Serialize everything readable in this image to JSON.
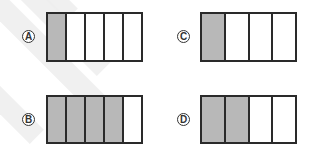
{
  "colors": {
    "shaded": "#b8b8b8",
    "unshaded": "#ffffff",
    "stroke": "#2a2a2a"
  },
  "options": [
    {
      "id": "A",
      "label": "A",
      "parts": 5,
      "shaded": 1,
      "fraction": "1/5"
    },
    {
      "id": "B",
      "label": "B",
      "parts": 5,
      "shaded": 4,
      "fraction": "4/5"
    },
    {
      "id": "C",
      "label": "C",
      "parts": 4,
      "shaded": 1,
      "fraction": "1/4"
    },
    {
      "id": "D",
      "label": "D",
      "parts": 4,
      "shaded": 2,
      "fraction": "2/4"
    }
  ]
}
